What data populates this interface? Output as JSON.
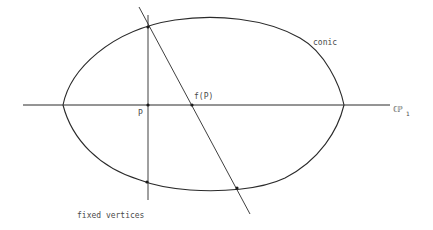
{
  "diagram": {
    "labels": {
      "conic": "conic",
      "fP": "f(P)",
      "P": "P",
      "line_main": "ℂℙ",
      "line_sub": "1",
      "fixed_vertices": "fixed vertices"
    },
    "elements": {
      "conic": {
        "shape": "egg-shaped closed curve",
        "left_vertex": [
          63,
          105
        ],
        "right_vertex": [
          344,
          105
        ],
        "top_y": 18,
        "bottom_y": 191
      },
      "horizontal_line": {
        "from": [
          23,
          105
        ],
        "to": [
          390,
          105
        ],
        "represents": "ℂℙ1"
      },
      "vertical_line": {
        "from": [
          148,
          15
        ],
        "to": [
          148,
          200
        ]
      },
      "slanted_line": {
        "from": [
          139,
          7
        ],
        "to": [
          250,
          214
        ]
      },
      "points": [
        {
          "name": "top-intersection",
          "at": [
            148,
            27
          ]
        },
        {
          "name": "P",
          "at": [
            148,
            105
          ]
        },
        {
          "name": "f(P)",
          "at": [
            192,
            105
          ]
        },
        {
          "name": "bottom-left-intersection",
          "at": [
            147,
            182
          ]
        },
        {
          "name": "bottom-right-intersection",
          "at": [
            237,
            188
          ]
        }
      ]
    },
    "colors": {
      "stroke": "#2a2a2a",
      "text": "#4a4a4a",
      "background": "#ffffff"
    }
  }
}
